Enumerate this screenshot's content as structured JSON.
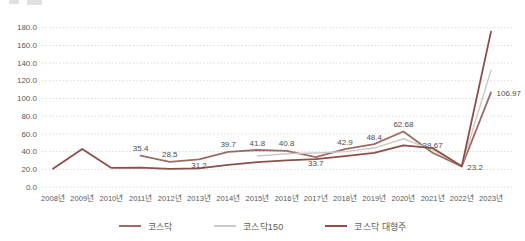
{
  "chart_data": {
    "type": "line",
    "title": "",
    "xlabel": "",
    "ylabel": "",
    "ylim": [
      0,
      180
    ],
    "ytick_step": 20,
    "yticks": [
      "0.0",
      "20.0",
      "40.0",
      "60.0",
      "80.0",
      "100.0",
      "120.0",
      "140.0",
      "160.0",
      "180.0"
    ],
    "grid": "horizontal-dotted",
    "legend_position": "bottom",
    "categories": [
      "2008년",
      "2009년",
      "2010년",
      "2011년",
      "2012년",
      "2013년",
      "2014년",
      "2015년",
      "2016년",
      "2017년",
      "2018년",
      "2019년",
      "2020년",
      "2021년",
      "2022년",
      "2023년"
    ],
    "series": [
      {
        "name": "코스닥",
        "color": "#9c6b64",
        "width": 1.8,
        "values": [
          null,
          null,
          null,
          35.4,
          28.5,
          31.2,
          39.7,
          41.8,
          40.8,
          33.7,
          42.9,
          48.4,
          62.68,
          38.67,
          23.2,
          106.97
        ],
        "labels": [
          null,
          null,
          null,
          "35.4",
          "28.5",
          "31.2",
          "39.7",
          "41.8",
          "40.8",
          "33.7",
          "42.9",
          "48.4",
          "62.68",
          "38.67",
          "23.2",
          "106.97"
        ],
        "label_pos": [
          null,
          null,
          null,
          "above",
          "above",
          "below",
          "above",
          "above",
          "above",
          "below",
          "above",
          "above",
          "above",
          "above",
          "right",
          "right"
        ]
      },
      {
        "name": "코스닥150",
        "color": "#cfc9c5",
        "width": 1.4,
        "values": [
          null,
          null,
          null,
          null,
          null,
          null,
          null,
          35,
          37.5,
          38.5,
          40,
          44,
          54.5,
          42,
          24,
          132
        ],
        "labels": [],
        "label_pos": []
      },
      {
        "name": "코스닥 대형주",
        "color": "#8c4f46",
        "width": 1.8,
        "values": [
          20.5,
          43,
          21.5,
          22,
          20.5,
          21,
          25,
          28,
          30,
          31.5,
          35,
          38.5,
          47,
          44,
          23.5,
          175.5
        ],
        "labels": [],
        "label_pos": []
      }
    ],
    "label_color": "#4d4d4d",
    "axis_text_color": "#595959",
    "grid_color": "#d9d9d9"
  }
}
